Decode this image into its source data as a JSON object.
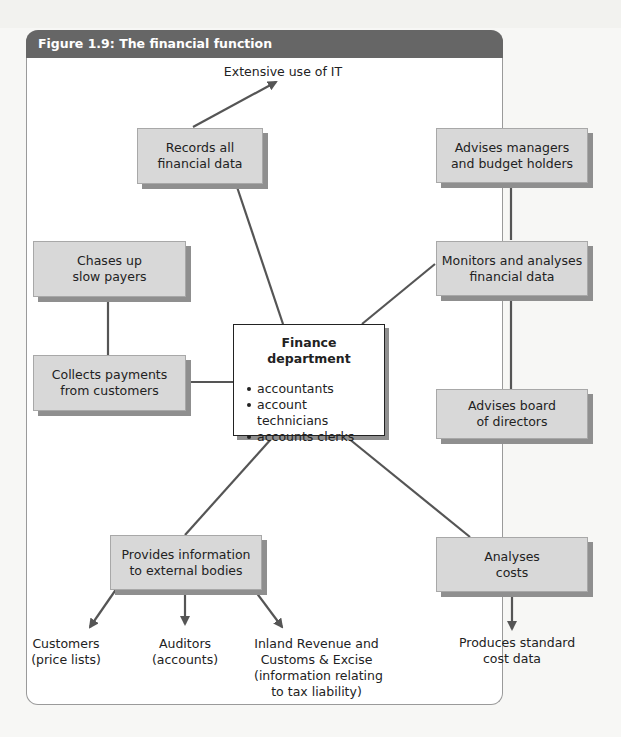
{
  "figure": {
    "title": "Figure 1.9: The financial function"
  },
  "colors": {
    "header_bg": "#666666",
    "box_fill": "#d8d8d8",
    "box_shadow": "#8f8f8f",
    "connector": "#555555",
    "panel_bg": "#ffffff"
  },
  "center": {
    "title": "Finance department",
    "items": [
      "accountants",
      "account technicians",
      "accounts clerks"
    ]
  },
  "boxes": {
    "records": {
      "line1": "Records all",
      "line2": "financial data"
    },
    "advises_managers": {
      "line1": "Advises managers",
      "line2": "and budget holders"
    },
    "chases": {
      "line1": "Chases up",
      "line2": "slow payers"
    },
    "monitors": {
      "line1": "Monitors and analyses",
      "line2": "financial data"
    },
    "collects": {
      "line1": "Collects payments",
      "line2": "from customers"
    },
    "advises_board": {
      "line1": "Advises board",
      "line2": "of directors"
    },
    "provides": {
      "line1": "Provides information",
      "line2": "to external bodies"
    },
    "analyses": {
      "line1": "Analyses",
      "line2": "costs"
    }
  },
  "outputs": {
    "it": {
      "line1": "Extensive use of IT"
    },
    "customers": {
      "line1": "Customers",
      "line2": "(price lists)"
    },
    "auditors": {
      "line1": "Auditors",
      "line2": "(accounts)"
    },
    "inland": {
      "line1": "Inland Revenue and",
      "line2": "Customs & Excise",
      "line3": "(information relating",
      "line4": "to tax liability)"
    },
    "standard": {
      "line1": "Produces standard",
      "line2": "cost data"
    }
  },
  "connections": [
    {
      "from": "center",
      "to": "records",
      "type": "line"
    },
    {
      "from": "records",
      "to": "it",
      "type": "arrow"
    },
    {
      "from": "center",
      "to": "monitors",
      "type": "line"
    },
    {
      "from": "monitors",
      "to": "advises_managers",
      "type": "line"
    },
    {
      "from": "monitors",
      "to": "advises_board",
      "type": "line"
    },
    {
      "from": "center",
      "to": "collects",
      "type": "line"
    },
    {
      "from": "collects",
      "to": "chases",
      "type": "line"
    },
    {
      "from": "center",
      "to": "provides",
      "type": "line"
    },
    {
      "from": "provides",
      "to": "customers",
      "type": "arrow"
    },
    {
      "from": "provides",
      "to": "auditors",
      "type": "arrow"
    },
    {
      "from": "provides",
      "to": "inland",
      "type": "arrow"
    },
    {
      "from": "center",
      "to": "analyses",
      "type": "line"
    },
    {
      "from": "analyses",
      "to": "standard",
      "type": "arrow"
    }
  ]
}
